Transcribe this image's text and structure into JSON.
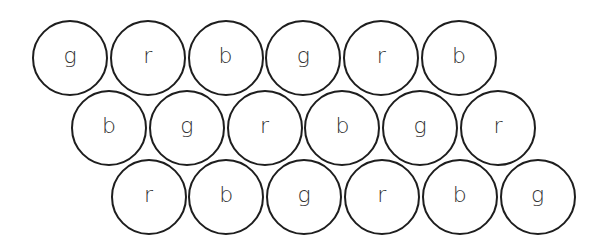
{
  "diagram": {
    "title": "",
    "layout": {
      "radius": 38,
      "spacing": 77.8,
      "stroke_color": "#1e1e1e",
      "text_color": "#333333",
      "rows": [
        {
          "start_cx": 70,
          "cy": 58
        },
        {
          "start_cx": 109,
          "cy": 128
        },
        {
          "start_cx": 148.5,
          "cy": 197
        }
      ]
    },
    "rows": [
      {
        "circles": [
          {
            "label": "g"
          },
          {
            "label": "r"
          },
          {
            "label": "b"
          },
          {
            "label": "g"
          },
          {
            "label": "r"
          },
          {
            "label": "b"
          }
        ]
      },
      {
        "circles": [
          {
            "label": "b"
          },
          {
            "label": "g"
          },
          {
            "label": "r"
          },
          {
            "label": "b"
          },
          {
            "label": "g"
          },
          {
            "label": "r"
          }
        ]
      },
      {
        "circles": [
          {
            "label": "r"
          },
          {
            "label": "b"
          },
          {
            "label": "g"
          },
          {
            "label": "r"
          },
          {
            "label": "b"
          },
          {
            "label": "g"
          }
        ]
      }
    ]
  }
}
